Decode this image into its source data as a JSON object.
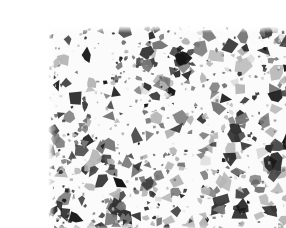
{
  "image": {
    "title": "Grayscale angular mosaic texture",
    "kind": "texture-sample",
    "width": 286,
    "height": 228,
    "caption": "",
    "background_color": "#ffffff",
    "margin": {
      "left": 8,
      "top": 10,
      "right": 8,
      "bottom": 12
    },
    "texture_region": {
      "x": 8,
      "y": 10,
      "width": 270,
      "height": 206
    },
    "description": "Dense field of small angular polygonal fragments (triangles, quadrilaterals, pentagons) in varying shades of gray scattered over a white background, resembling a crushed-aggregate or terrazzo surface.",
    "palette": {
      "background": "#ffffff",
      "paper": "#fbfbfb",
      "darkest_fragment": "#161616",
      "dark_fragment": "#333333",
      "mid_fragment": "#777777",
      "light_fragment": "#b5b5b5",
      "lightest_fragment": "#dcdcdc",
      "seam": "#f2f2f2"
    },
    "statistics": {
      "fragment_count": 620,
      "min_fragment_px": 3,
      "max_fragment_px": 18,
      "mean_fragment_px": 8,
      "vertices_per_fragment_min": 3,
      "vertices_per_fragment_max": 6,
      "coverage_percent": 46,
      "gray_levels": 7,
      "seed": 20240517
    },
    "density_map": {
      "note": "Relative fragment density and darkness per quadrant, read off the screenshot.",
      "quadrants": [
        {
          "name": "top-left",
          "density": 0.95,
          "darkness": 0.62
        },
        {
          "name": "top-right",
          "density": 0.88,
          "darkness": 0.5
        },
        {
          "name": "bottom-left",
          "density": 1.0,
          "darkness": 0.72
        },
        {
          "name": "bottom-right",
          "density": 0.9,
          "darkness": 0.55
        }
      ]
    }
  }
}
